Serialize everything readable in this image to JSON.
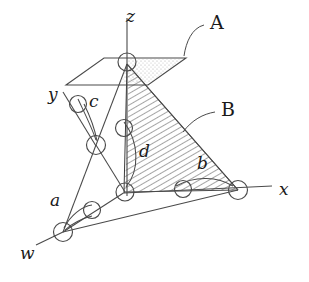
{
  "figure": {
    "type": "geometric-diagram",
    "background_color": "#ffffff",
    "stroke_color": "#3c3c3c",
    "hatch_color": "#555555",
    "stipple_color": "#9a9a9a"
  },
  "axes": [
    {
      "id": "z",
      "label": "z",
      "style": "italic",
      "x": 131,
      "y": 12
    },
    {
      "id": "y",
      "label": "y",
      "style": "italic",
      "x": 50,
      "y": 88
    },
    {
      "id": "x",
      "label": "x",
      "style": "italic",
      "x": 280,
      "y": 187
    },
    {
      "id": "w",
      "label": "w",
      "style": "italic",
      "x": 22,
      "y": 248
    }
  ],
  "region_labels": [
    {
      "id": "A",
      "label": "A",
      "style": "roman",
      "x": 212,
      "y": 20,
      "describes": "plane-a"
    },
    {
      "id": "B",
      "label": "B",
      "style": "roman",
      "x": 222,
      "y": 108,
      "describes": "hatched-region-b"
    }
  ],
  "edge_labels": [
    {
      "id": "a",
      "label": "a",
      "style": "italic",
      "x": 52,
      "y": 198
    },
    {
      "id": "b",
      "label": "b",
      "style": "italic",
      "x": 198,
      "y": 162
    },
    {
      "id": "c",
      "label": "c",
      "style": "italic",
      "x": 91,
      "y": 98
    },
    {
      "id": "d",
      "label": "d",
      "style": "italic",
      "x": 140,
      "y": 150
    }
  ],
  "nodes": [
    {
      "id": "apex",
      "cx": 127,
      "cy": 62,
      "r": 9
    },
    {
      "id": "left-mid",
      "cx": 96,
      "cy": 145,
      "r": 9
    },
    {
      "id": "center",
      "cx": 125,
      "cy": 192,
      "r": 9
    },
    {
      "id": "x-node",
      "cx": 238,
      "cy": 190,
      "r": 9
    },
    {
      "id": "w-node",
      "cx": 63,
      "cy": 232,
      "r": 9
    },
    {
      "id": "arc-node-c",
      "cx": 78,
      "cy": 106,
      "r": 8
    },
    {
      "id": "arc-node-d",
      "cx": 124,
      "cy": 130,
      "r": 8
    },
    {
      "id": "arc-node-a",
      "cx": 92,
      "cy": 211,
      "r": 8
    },
    {
      "id": "arc-node-b",
      "cx": 183,
      "cy": 189,
      "r": 8
    }
  ],
  "plane_a": {
    "name": "plane-a",
    "points": "66,84 104,58 185,58 148,84",
    "stipple_points": "128,60 183,60 149,83 122,83"
  },
  "hatched_region_b": {
    "name": "hatched-region-b",
    "outline": "M127,64 L238,190 L124,192"
  }
}
